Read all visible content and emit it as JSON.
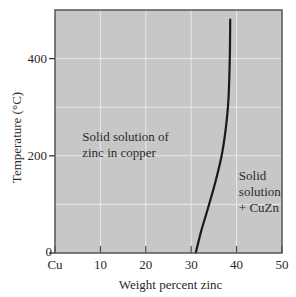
{
  "chart_data": {
    "type": "line",
    "title": "",
    "xlabel": "Weight percent zinc",
    "ylabel": "Temperature (°C)",
    "xlim": [
      0,
      50
    ],
    "ylim": [
      0,
      500
    ],
    "x_ticks": [
      0,
      10,
      20,
      30,
      40,
      50
    ],
    "x_tick_labels": [
      "Cu",
      "10",
      "20",
      "30",
      "40",
      "50"
    ],
    "y_ticks": [
      0,
      200,
      400
    ],
    "y_tick_labels": [
      "0",
      "200",
      "400"
    ],
    "grid": true,
    "grid_x": [
      10,
      20,
      30,
      40
    ],
    "grid_y": [
      100,
      200,
      300,
      400
    ],
    "legend": null,
    "series": [
      {
        "name": "Solvus (solubility limit of zinc in copper)",
        "x": [
          31.0,
          32.2,
          33.6,
          35.3,
          36.7,
          37.6,
          38.2,
          38.5,
          38.6
        ],
        "y": [
          0,
          45,
          89,
          145,
          200,
          255,
          315,
          400,
          480
        ]
      }
    ],
    "annotations": [
      {
        "text": [
          "Solid solution of",
          "zinc in copper"
        ],
        "x": 6,
        "y": 230
      },
      {
        "text": [
          "Solid",
          "solution",
          "+ CuZn"
        ],
        "x": 40.5,
        "y": 150
      }
    ]
  },
  "colors": {
    "plot_background": "#c7c7c7",
    "gridline": "#e8e8e8",
    "frame": "#555555",
    "curve": "#1a1a1a",
    "text": "#2a2a2a"
  }
}
